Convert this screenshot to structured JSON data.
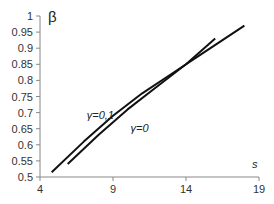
{
  "chart_data": {
    "type": "line",
    "title": "",
    "xlabel": "s",
    "ylabel": "β",
    "xlim": [
      4,
      19
    ],
    "ylim": [
      0.5,
      1
    ],
    "xticks": [
      4,
      9,
      14,
      19
    ],
    "yticks": [
      0.5,
      0.55,
      0.6,
      0.65,
      0.7,
      0.75,
      0.8,
      0.85,
      0.9,
      0.95,
      1
    ],
    "ytick_labels": [
      "0.5",
      "0.55",
      "0.6",
      "0.65",
      "0.7",
      "0.75",
      "0.8",
      "0.85",
      "0.9",
      "0.95",
      "1"
    ],
    "grid": false,
    "legend": "inline annotations",
    "series": [
      {
        "name": "γ=0,1",
        "x": [
          4.8,
          7,
          9,
          11,
          13,
          15,
          16.5,
          18
        ],
        "y": [
          0.515,
          0.61,
          0.69,
          0.76,
          0.82,
          0.88,
          0.925,
          0.97
        ]
      },
      {
        "name": "γ=0",
        "x": [
          5.9,
          8,
          10,
          12,
          14,
          16
        ],
        "y": [
          0.54,
          0.63,
          0.71,
          0.78,
          0.85,
          0.93
        ]
      }
    ],
    "annotations": [
      {
        "text": "γ=0,1",
        "x": 7.2,
        "y": 0.68
      },
      {
        "text": "γ=0",
        "x": 10.2,
        "y": 0.64
      }
    ]
  }
}
